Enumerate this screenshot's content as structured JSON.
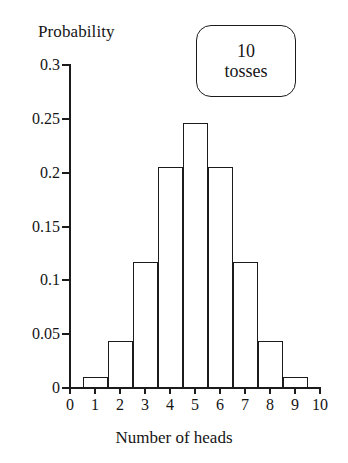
{
  "chart_data": {
    "type": "bar",
    "title": "",
    "xlabel": "Number of heads",
    "ylabel": "Probability",
    "categories": [
      "0",
      "1",
      "2",
      "3",
      "4",
      "5",
      "6",
      "7",
      "8",
      "9",
      "10"
    ],
    "values": [
      0.001,
      0.01,
      0.044,
      0.117,
      0.205,
      0.246,
      0.205,
      0.117,
      0.044,
      0.01,
      0.001
    ],
    "xlim": [
      0,
      10
    ],
    "ylim": [
      0,
      0.3
    ],
    "yticks": [
      0,
      0.05,
      0.1,
      0.15,
      0.2,
      0.25,
      0.3
    ],
    "ytick_labels": [
      "0",
      "0.05",
      "0.1",
      "0.15",
      "0.2",
      "0.25",
      "0.3"
    ],
    "xticks": [
      0,
      1,
      2,
      3,
      4,
      5,
      6,
      7,
      8,
      9,
      10
    ],
    "xtick_labels": [
      "0",
      "1",
      "2",
      "3",
      "4",
      "5",
      "6",
      "7",
      "8",
      "9",
      "10"
    ],
    "grid": false,
    "legend": null,
    "annotations": [
      {
        "name": "tosses-box",
        "line1": "10",
        "line2": "tosses"
      }
    ],
    "colors": {
      "axis": "#1b1b1b",
      "bar_edge": "#1b1b1b",
      "bar_fill": "transparent",
      "background": "#ffffff"
    }
  }
}
